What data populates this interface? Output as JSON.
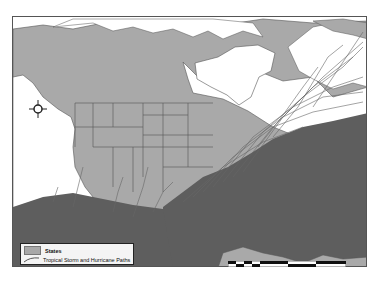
{
  "map": {
    "title": "Tropical Storm and Hurricane Paths over North America",
    "colors": {
      "land": "#a9a9a9",
      "water": "#ffffff",
      "borders": "#555555",
      "storm_paths": "#5e5e5e",
      "frame": "#555555"
    }
  },
  "legend": {
    "items": [
      {
        "label": "States",
        "symbol": "polygon"
      },
      {
        "label": "Tropical Storm and Hurricane Paths",
        "symbol": "line"
      }
    ]
  },
  "compass": {
    "n": "N",
    "s": "S",
    "e": "E",
    "w": "W"
  },
  "scale_bar": {
    "segments": 6
  }
}
